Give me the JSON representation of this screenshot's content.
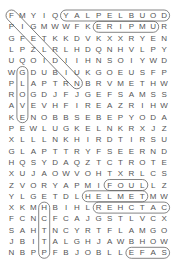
{
  "puzzle": {
    "rows": [
      "FMYIQYALPELBUOD",
      "PIGMWWFKERIPMUR",
      "GFETKKDVKXXRYEN",
      "LPZLRLHDQNHVLPY",
      "UQOIDIIHNSOIYWD",
      "WGDUBIUKGOEUSFP",
      "PLAPTRNBRVMETHW",
      "ROGDJFJGEFSAMSS",
      "AVEVHFIREAZRIHW",
      "KENOBBSEBEPYODA",
      "PEWLUGKELNKRXJZ",
      "XLLLNKHIRDTIRSU",
      "GLAPTTRYFSEERND",
      "HQSYDAQZTCTROTE",
      "XUJAOWVOHTXRLCS",
      "ZVORYAPMIFOULLZ",
      "YLGETDLHELMETMW",
      "XKMHBIHLREHCTAC",
      "FCNCFCAJGSTLVCX",
      "SAHTNCYRTFLAMGO",
      "JBITALGHJAWBHOW",
      "NBPPFBJOBLLEFAS"
    ],
    "found_words": [
      {
        "word": "DOUBLEPLAY",
        "r1": 0,
        "c1": 14,
        "r2": 0,
        "c2": 5
      },
      {
        "word": "UMPIRE",
        "r1": 1,
        "c1": 13,
        "r2": 1,
        "c2": 8
      },
      {
        "word": "FOUL",
        "r1": 15,
        "c1": 9,
        "r2": 15,
        "c2": 12
      },
      {
        "word": "HELMET",
        "r1": 16,
        "c1": 7,
        "r2": 16,
        "c2": 12
      },
      {
        "word": "CATCHER",
        "r1": 17,
        "c1": 14,
        "r2": 17,
        "c2": 8
      },
      {
        "word": "SAFE",
        "r1": 21,
        "c1": 14,
        "r2": 21,
        "c2": 11
      },
      {
        "word": "GLOVE",
        "r1": 5,
        "c1": 1,
        "r2": 9,
        "c2": 1
      },
      {
        "word": "PITCH",
        "r1": 21,
        "c1": 3,
        "r2": 17,
        "c2": 3
      },
      {
        "word": "FIELDER",
        "r1": 0,
        "c1": 0,
        "r2": 6,
        "c2": 6
      }
    ]
  }
}
